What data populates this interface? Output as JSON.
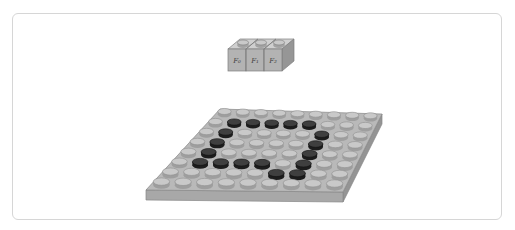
{
  "frame": {
    "background": "#ffffff",
    "border_color": "#d6d6d6"
  },
  "bricks": {
    "count": 3,
    "labels": [
      {
        "text": "F₀"
      },
      {
        "text": "F₁"
      },
      {
        "text": "F₂"
      }
    ],
    "colors": {
      "front": "#b3b3b3",
      "top": "#cfcfcf",
      "side": "#969696",
      "stud_top": "#c9c9c9",
      "stud_side": "#a2a2a2",
      "outline": "#7e7e7e",
      "label_color": "#3c3c3c"
    }
  },
  "plate": {
    "rows": 8,
    "cols": 9,
    "colors": {
      "top": "#b9b9b9",
      "front": "#a8a8a8",
      "side": "#949494",
      "outline": "#878787",
      "stud_light_top": "#c9c9c9",
      "stud_light_side": "#9e9e9e",
      "stud_light_rim": "#8f8f8f",
      "stud_dark_top": "#3f3f3f",
      "stud_dark_side": "#1d1d1d",
      "stud_dark_rim": "#101010"
    },
    "dark_studs": [
      [
        2,
        2
      ],
      [
        2,
        3
      ],
      [
        2,
        4
      ],
      [
        2,
        5
      ],
      [
        2,
        6
      ],
      [
        3,
        2
      ],
      [
        3,
        7
      ],
      [
        4,
        2
      ],
      [
        4,
        7
      ],
      [
        5,
        2
      ],
      [
        5,
        7
      ],
      [
        6,
        2
      ],
      [
        6,
        3
      ],
      [
        6,
        4
      ],
      [
        6,
        5
      ],
      [
        6,
        7
      ],
      [
        7,
        6
      ],
      [
        7,
        7
      ]
    ]
  }
}
